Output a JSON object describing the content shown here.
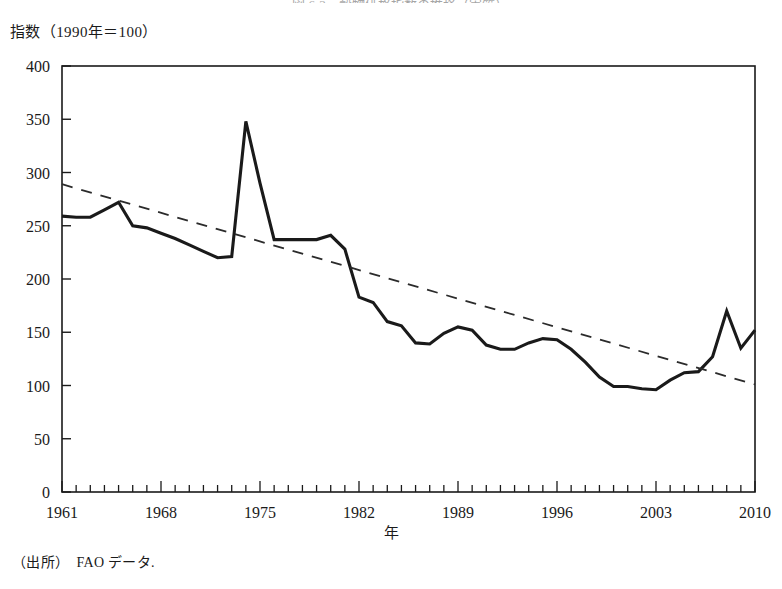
{
  "figure": {
    "title": "図 6-3　穀物価格指数の推移（実質）",
    "ylabel": "指数（1990年＝100）",
    "xlabel": "年",
    "source": "（出所）　FAO データ."
  },
  "chart_data": {
    "type": "line",
    "title": "図 6-3　穀物価格指数の推移（実質）",
    "xlabel": "年",
    "ylabel": "指数（1990年＝100）",
    "xlim": [
      1961,
      2010
    ],
    "ylim": [
      0,
      400
    ],
    "ytick_step": 50,
    "yticks": [
      0,
      50,
      100,
      150,
      200,
      250,
      300,
      350,
      400
    ],
    "xticks_labeled": [
      1961,
      1968,
      1975,
      1982,
      1989,
      1996,
      2003,
      2010
    ],
    "xtick_minor_step": 1,
    "grid": false,
    "legend": null,
    "colors": {
      "series_line": "#1a1a1a",
      "trend_line": "#2b2b2b",
      "axis": "#1a1a1a",
      "background": "#ffffff"
    },
    "series": [
      {
        "name": "穀物価格指数（実質）",
        "style": "solid",
        "x": [
          1961,
          1962,
          1963,
          1964,
          1965,
          1966,
          1967,
          1968,
          1969,
          1970,
          1971,
          1972,
          1973,
          1974,
          1975,
          1976,
          1977,
          1978,
          1979,
          1980,
          1981,
          1982,
          1983,
          1984,
          1985,
          1986,
          1987,
          1988,
          1989,
          1990,
          1991,
          1992,
          1993,
          1994,
          1995,
          1996,
          1997,
          1998,
          1999,
          2000,
          2001,
          2002,
          2003,
          2004,
          2005,
          2006,
          2007,
          2008,
          2009,
          2010
        ],
        "values": [
          259,
          258,
          258,
          265,
          272,
          250,
          248,
          243,
          238,
          232,
          226,
          220,
          221,
          348,
          290,
          237,
          237,
          237,
          237,
          241,
          228,
          183,
          178,
          160,
          156,
          140,
          139,
          149,
          155,
          152,
          138,
          134,
          134,
          140,
          144,
          143,
          134,
          122,
          108,
          99,
          99,
          97,
          96,
          105,
          112,
          113,
          127,
          170,
          135,
          152
        ]
      },
      {
        "name": "趨勢線（線形トレンド）",
        "style": "dashed",
        "x": [
          1961,
          2010
        ],
        "values": [
          289,
          101
        ]
      }
    ]
  }
}
